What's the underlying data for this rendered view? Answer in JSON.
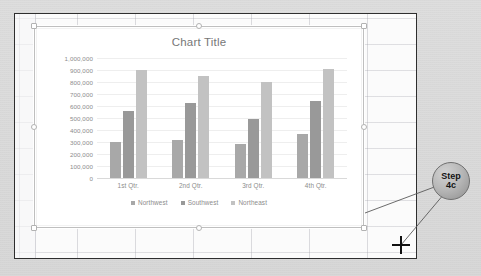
{
  "app": {
    "callout": {
      "line1": "Step",
      "line2": "4c",
      "name": "step-4c-callout"
    },
    "cursor_icon": "crosshair-icon"
  },
  "chart": {
    "title": "Chart Title",
    "selected": true,
    "handles": [
      "top-left",
      "top-center",
      "top-right",
      "middle-left",
      "middle-right",
      "bottom-left",
      "bottom-center",
      "bottom-right"
    ]
  },
  "chart_data": {
    "type": "bar",
    "title": "Chart Title",
    "xlabel": "",
    "ylabel": "",
    "categories": [
      "1st Qtr.",
      "2nd Qtr.",
      "3rd Qtr.",
      "4th Qtr."
    ],
    "series": [
      {
        "name": "Northwest",
        "values": [
          300000,
          320000,
          285000,
          365000
        ],
        "color": "#a8a8a8"
      },
      {
        "name": "Southwest",
        "values": [
          560000,
          625000,
          490000,
          645000
        ],
        "color": "#999999"
      },
      {
        "name": "Northeast",
        "values": [
          900000,
          850000,
          800000,
          910000
        ],
        "color": "#c2c2c2"
      }
    ],
    "ylim": [
      0,
      1000000
    ],
    "ytick_labels": [
      "1,000,000",
      "900,000",
      "800,000",
      "700,000",
      "600,000",
      "500,000",
      "400,000",
      "300,000",
      "200,000",
      "100,000",
      "0"
    ],
    "ytick_values": [
      1000000,
      900000,
      800000,
      700000,
      600000,
      500000,
      400000,
      300000,
      200000,
      100000,
      0
    ],
    "grid": true,
    "legend_position": "bottom"
  }
}
